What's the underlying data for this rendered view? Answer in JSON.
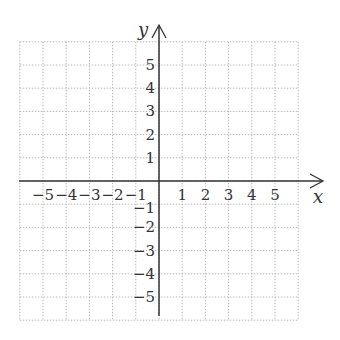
{
  "diagram": {
    "type": "coordinate-plane",
    "x_axis_label": "x",
    "y_axis_label": "y",
    "x_range": [
      -6,
      6
    ],
    "y_range": [
      -6,
      6
    ],
    "x_tick_labels": [
      "−5",
      "−4",
      "−3",
      "−2",
      "−1",
      "1",
      "2",
      "3",
      "4",
      "5"
    ],
    "y_tick_labels": [
      "5",
      "4",
      "3",
      "2",
      "1",
      "−1",
      "−2",
      "−3",
      "−4",
      "−5"
    ],
    "grid": "dotted",
    "colors": {
      "axis": "#333333",
      "grid": "#b8b8b8",
      "text": "#333333"
    }
  }
}
